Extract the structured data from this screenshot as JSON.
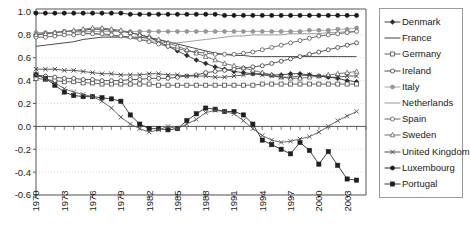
{
  "chart_data": {
    "type": "line",
    "title": "",
    "xlabel": "",
    "ylabel": "",
    "ylim": [
      -0.6,
      1.0
    ],
    "yticks": [
      1.0,
      0.8,
      0.6,
      0.4,
      0.2,
      0.0,
      -0.2,
      -0.4,
      -0.6
    ],
    "ytick_labels": [
      "1.0",
      "0.8",
      "0.6",
      "0.4",
      "0.2",
      "0.0",
      "-0.2",
      "-0.4",
      "-0.6"
    ],
    "xlim": [
      1970,
      2005
    ],
    "xticks": [
      1970,
      1973,
      1976,
      1979,
      1982,
      1985,
      1988,
      1991,
      1994,
      1997,
      2000,
      2003
    ],
    "xtick_labels": [
      "1970",
      "1973",
      "1976",
      "1979",
      "1982",
      "1985",
      "1988",
      "1991",
      "1994",
      "1997",
      "2000",
      "2003"
    ],
    "grid": true,
    "legend_position": "right",
    "x": [
      1970,
      1971,
      1972,
      1973,
      1974,
      1975,
      1976,
      1977,
      1978,
      1979,
      1980,
      1981,
      1982,
      1983,
      1984,
      1985,
      1986,
      1987,
      1988,
      1989,
      1990,
      1991,
      1992,
      1993,
      1994,
      1995,
      1996,
      1997,
      1998,
      1999,
      2000,
      2001,
      2002,
      2003,
      2004
    ],
    "series": [
      {
        "name": "Denmark",
        "marker": "diamond-filled",
        "color": "#2b2b2b",
        "values": [
          0.8,
          0.81,
          0.82,
          0.83,
          0.83,
          0.84,
          0.85,
          0.85,
          0.84,
          0.83,
          0.82,
          0.8,
          0.78,
          0.74,
          0.7,
          0.66,
          0.62,
          0.58,
          0.55,
          0.52,
          0.5,
          0.48,
          0.47,
          0.46,
          0.46,
          0.45,
          0.45,
          0.46,
          0.46,
          0.45,
          0.44,
          0.43,
          0.42,
          0.4,
          0.39
        ]
      },
      {
        "name": "France",
        "marker": "none",
        "color": "#2b2b2b",
        "values": [
          0.7,
          0.71,
          0.72,
          0.73,
          0.74,
          0.76,
          0.77,
          0.78,
          0.78,
          0.78,
          0.78,
          0.78,
          0.77,
          0.76,
          0.74,
          0.72,
          0.7,
          0.68,
          0.66,
          0.64,
          0.63,
          0.62,
          0.62,
          0.61,
          0.61,
          0.61,
          0.61,
          0.61,
          0.61,
          0.61,
          0.61,
          0.61,
          0.61,
          0.61,
          0.61
        ]
      },
      {
        "name": "Germany",
        "marker": "square-open",
        "color": "#4a4a4a",
        "values": [
          0.42,
          0.41,
          0.4,
          0.39,
          0.39,
          0.38,
          0.38,
          0.37,
          0.37,
          0.37,
          0.37,
          0.37,
          0.37,
          0.36,
          0.36,
          0.36,
          0.36,
          0.36,
          0.36,
          0.36,
          0.36,
          0.36,
          0.36,
          0.36,
          0.37,
          0.37,
          0.37,
          0.37,
          0.37,
          0.37,
          0.37,
          0.37,
          0.37,
          0.37,
          0.37
        ]
      },
      {
        "name": "Ireland",
        "marker": "circle-open",
        "color": "#3a3a3a",
        "values": [
          0.45,
          0.44,
          0.43,
          0.42,
          0.42,
          0.41,
          0.41,
          0.4,
          0.4,
          0.4,
          0.41,
          0.41,
          0.42,
          0.42,
          0.42,
          0.43,
          0.44,
          0.45,
          0.47,
          0.48,
          0.49,
          0.5,
          0.51,
          0.52,
          0.53,
          0.55,
          0.57,
          0.59,
          0.61,
          0.63,
          0.65,
          0.67,
          0.69,
          0.71,
          0.73
        ]
      },
      {
        "name": "Italy",
        "marker": "circle-filled-gray",
        "color": "#9a9a9a",
        "values": [
          0.82,
          0.82,
          0.82,
          0.83,
          0.83,
          0.83,
          0.83,
          0.83,
          0.83,
          0.83,
          0.83,
          0.83,
          0.83,
          0.83,
          0.83,
          0.83,
          0.83,
          0.83,
          0.83,
          0.83,
          0.83,
          0.83,
          0.83,
          0.83,
          0.83,
          0.83,
          0.83,
          0.83,
          0.83,
          0.84,
          0.84,
          0.84,
          0.85,
          0.85,
          0.86
        ]
      },
      {
        "name": "Netherlands",
        "marker": "none-gray",
        "color": "#8d8d8d",
        "values": [
          0.81,
          0.82,
          0.82,
          0.83,
          0.83,
          0.82,
          0.81,
          0.8,
          0.79,
          0.78,
          0.77,
          0.76,
          0.75,
          0.74,
          0.73,
          0.73,
          0.74,
          0.75,
          0.76,
          0.77,
          0.78,
          0.79,
          0.79,
          0.8,
          0.8,
          0.8,
          0.8,
          0.81,
          0.81,
          0.81,
          0.81,
          0.82,
          0.82,
          0.83,
          0.83
        ]
      },
      {
        "name": "Spain",
        "marker": "circle-open2",
        "color": "#555555",
        "values": [
          0.78,
          0.78,
          0.79,
          0.8,
          0.8,
          0.81,
          0.81,
          0.81,
          0.8,
          0.79,
          0.78,
          0.76,
          0.74,
          0.72,
          0.7,
          0.68,
          0.66,
          0.65,
          0.64,
          0.63,
          0.63,
          0.63,
          0.64,
          0.65,
          0.67,
          0.69,
          0.71,
          0.73,
          0.75,
          0.77,
          0.79,
          0.8,
          0.81,
          0.82,
          0.83
        ]
      },
      {
        "name": "Sweden",
        "marker": "triangle-open",
        "color": "#606060",
        "values": [
          0.8,
          0.81,
          0.82,
          0.83,
          0.84,
          0.85,
          0.86,
          0.86,
          0.85,
          0.84,
          0.82,
          0.8,
          0.78,
          0.76,
          0.73,
          0.7,
          0.67,
          0.64,
          0.61,
          0.58,
          0.55,
          0.53,
          0.51,
          0.49,
          0.47,
          0.45,
          0.43,
          0.42,
          0.42,
          0.43,
          0.44,
          0.45,
          0.46,
          0.47,
          0.48
        ]
      },
      {
        "name": "United Kingdom",
        "marker": "x-cross",
        "color": "#3d3d3d",
        "values": [
          0.5,
          0.5,
          0.5,
          0.49,
          0.49,
          0.48,
          0.47,
          0.46,
          0.46,
          0.45,
          0.45,
          0.45,
          0.46,
          0.46,
          0.45,
          0.45,
          0.44,
          0.44,
          0.44,
          0.43,
          0.43,
          0.44,
          0.45,
          0.46,
          0.45,
          0.44,
          0.43,
          0.43,
          0.44,
          0.45,
          0.44,
          0.43,
          0.43,
          0.44,
          0.44
        ]
      },
      {
        "name": "Luxembourg",
        "marker": "circle-filled",
        "color": "#1a1a1a",
        "values": [
          0.99,
          0.99,
          0.99,
          0.99,
          0.99,
          0.99,
          0.99,
          0.99,
          0.99,
          0.99,
          0.98,
          0.98,
          0.98,
          0.98,
          0.98,
          0.98,
          0.98,
          0.98,
          0.98,
          0.98,
          0.97,
          0.97,
          0.97,
          0.97,
          0.97,
          0.97,
          0.97,
          0.97,
          0.97,
          0.97,
          0.97,
          0.97,
          0.97,
          0.97,
          0.97
        ]
      },
      {
        "name": "Portugal",
        "marker": "square-filled",
        "color": "#1f1f1f",
        "values": [
          0.45,
          0.42,
          0.36,
          0.3,
          0.27,
          0.26,
          0.26,
          0.25,
          0.24,
          0.22,
          0.1,
          0.02,
          -0.02,
          -0.02,
          -0.03,
          -0.02,
          0.05,
          0.11,
          0.16,
          0.15,
          0.13,
          0.13,
          0.1,
          0.02,
          -0.12,
          -0.16,
          -0.2,
          -0.24,
          -0.14,
          -0.21,
          -0.33,
          -0.22,
          -0.34,
          -0.46,
          -0.47
        ]
      }
    ],
    "secondary_series": [
      {
        "name": "sweden-x-lower",
        "marker": "x-cross",
        "color": "#555555",
        "values": [
          0.45,
          0.42,
          0.38,
          0.33,
          0.3,
          0.28,
          0.26,
          0.22,
          0.16,
          0.08,
          0.02,
          -0.02,
          -0.05,
          -0.03,
          0.0,
          -0.02,
          0.02,
          0.06,
          0.12,
          0.14,
          0.13,
          0.11,
          0.05,
          -0.02,
          -0.08,
          -0.12,
          -0.14,
          -0.13,
          -0.11,
          -0.09,
          -0.05,
          0.0,
          0.05,
          0.09,
          0.13
        ]
      }
    ]
  },
  "legend": {
    "items": [
      {
        "label": "Denmark",
        "marker": "diamond-filled",
        "color": "#2b2b2b"
      },
      {
        "label": "France",
        "marker": "none",
        "color": "#2b2b2b"
      },
      {
        "label": "Germany",
        "marker": "square-open",
        "color": "#4a4a4a"
      },
      {
        "label": "Ireland",
        "marker": "circle-open",
        "color": "#3a3a3a"
      },
      {
        "label": "Italy",
        "marker": "circle-filled-gray",
        "color": "#9a9a9a"
      },
      {
        "label": "Netherlands",
        "marker": "none-gray",
        "color": "#8d8d8d"
      },
      {
        "label": "Spain",
        "marker": "circle-open2",
        "color": "#555555"
      },
      {
        "label": "Sweden",
        "marker": "triangle-open",
        "color": "#606060"
      },
      {
        "label": "United Kingdom",
        "marker": "x-cross",
        "color": "#3d3d3d"
      },
      {
        "label": "Luxembourg",
        "marker": "circle-filled",
        "color": "#1a1a1a"
      },
      {
        "label": "Portugal",
        "marker": "square-filled",
        "color": "#1f1f1f"
      }
    ]
  },
  "colors": {
    "axis": "#555555",
    "grid": "#cccccc",
    "background": "#ffffff",
    "legend_border": "#9a9a9a"
  }
}
